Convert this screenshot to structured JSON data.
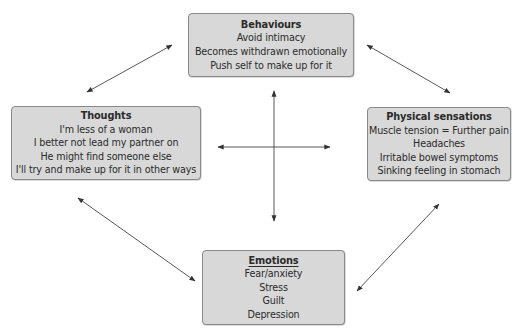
{
  "diagram": {
    "type": "cognitive-behavioural cycle",
    "boxes": {
      "behaviours": {
        "title": "Behaviours",
        "lines": [
          "Avoid intimacy",
          "Becomes withdrawn emotionally",
          "Push self to make up for it"
        ]
      },
      "thoughts": {
        "title": "Thoughts",
        "lines": [
          "I'm less of a woman",
          "I better not lead my partner on",
          "He might find someone else",
          "I'll try and make up for it in other ways"
        ]
      },
      "physical": {
        "title": "Physical sensations",
        "lines": [
          "Muscle tension = Further pain",
          "Headaches",
          "Irritable bowel symptoms",
          "Sinking feeling in stomach"
        ]
      },
      "emotions": {
        "title": "Emotions",
        "lines": [
          "Fear/anxiety",
          "Stress",
          "Guilt",
          "Depression"
        ]
      }
    },
    "connections": [
      {
        "from": "thoughts",
        "to": "behaviours",
        "style": "double-arrow"
      },
      {
        "from": "behaviours",
        "to": "physical",
        "style": "double-arrow"
      },
      {
        "from": "thoughts",
        "to": "emotions",
        "style": "double-arrow"
      },
      {
        "from": "physical",
        "to": "emotions",
        "style": "double-arrow"
      },
      {
        "from": "center",
        "to": "all",
        "style": "cross-double-arrows"
      }
    ],
    "colors": {
      "box_fill": "#d8d8d8",
      "box_border": "#8a8a8a",
      "arrow": "#333333",
      "text": "#2b2b2b"
    }
  }
}
